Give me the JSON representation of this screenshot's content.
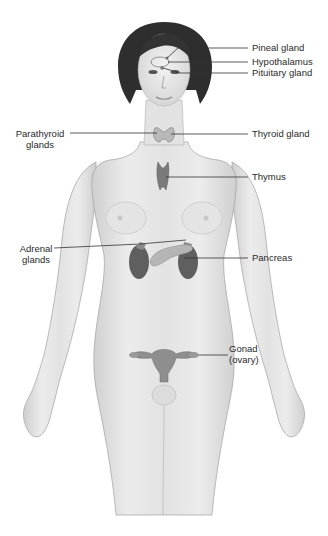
{
  "diagram": {
    "type": "anatomical-illustration",
    "labels": [
      {
        "id": "pineal",
        "text": "Pineal gland"
      },
      {
        "id": "hypothalamus",
        "text": "Hypothalamus"
      },
      {
        "id": "pituitary",
        "text": "Pituitary gland"
      },
      {
        "id": "parathyroid_1",
        "text": "Parathyroid"
      },
      {
        "id": "parathyroid_2",
        "text": "glands"
      },
      {
        "id": "thyroid",
        "text": "Thyroid gland"
      },
      {
        "id": "thymus",
        "text": "Thymus"
      },
      {
        "id": "adrenal_1",
        "text": "Adrenal"
      },
      {
        "id": "adrenal_2",
        "text": "glands"
      },
      {
        "id": "pancreas",
        "text": "Pancreas"
      },
      {
        "id": "gonad_1",
        "text": "Gonad"
      },
      {
        "id": "gonad_2",
        "text": "(ovary)"
      }
    ],
    "colors": {
      "skin": "#e6e6e6",
      "outline": "#9a9a9a",
      "hair": "#2b2b2b",
      "organ": "#6e6e6e",
      "organ_light": "#b5b5b5",
      "leader_line": "#333333"
    }
  }
}
